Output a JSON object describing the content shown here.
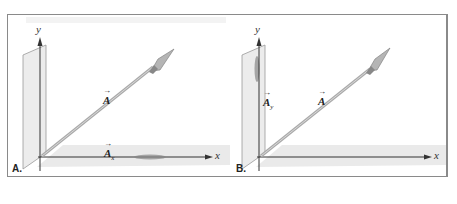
{
  "figure": {
    "panels": [
      {
        "id": "A",
        "label": "A.",
        "axis_x": "x",
        "axis_y": "y",
        "vector_label": "A",
        "component_label": "A",
        "component_sub": "x",
        "component_arrow": "→"
      },
      {
        "id": "B",
        "label": "B.",
        "axis_x": "x",
        "axis_y": "y",
        "vector_label": "A",
        "component_label": "A",
        "component_sub": "y",
        "component_arrow": "→"
      }
    ],
    "vector_arrow": "→",
    "colors": {
      "frame": "#8a8a8a",
      "axis": "#333333",
      "plane": "#e8e8e8",
      "spear": "#b8b8b8"
    }
  }
}
